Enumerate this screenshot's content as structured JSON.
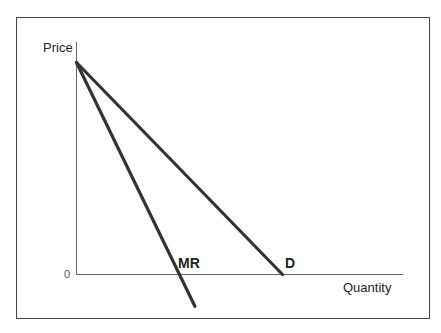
{
  "chart_data": {
    "type": "line",
    "title": "",
    "xlabel": "Quantity",
    "ylabel": "Price",
    "origin_label": "0",
    "grid": false,
    "legend": "inline labels",
    "xlim": [
      0,
      12
    ],
    "ylim": [
      -1.5,
      11
    ],
    "series": [
      {
        "name": "D",
        "label": "D",
        "points": [
          [
            0,
            10
          ],
          [
            10,
            0
          ]
        ],
        "color": "#333333"
      },
      {
        "name": "MR",
        "label": "MR",
        "points": [
          [
            0,
            10
          ],
          [
            5.75,
            -1.5
          ]
        ],
        "color": "#333333"
      }
    ],
    "annotations": [
      {
        "text": "D",
        "near": [
          10,
          0.6
        ]
      },
      {
        "text": "MR",
        "near": [
          5,
          0.6
        ]
      }
    ]
  },
  "labels": {
    "y_axis": "Price",
    "x_axis": "Quantity",
    "origin": "0",
    "mr": "MR",
    "d": "D"
  },
  "colors": {
    "line": "#333333",
    "axis": "#555555",
    "frame": "#444444"
  }
}
